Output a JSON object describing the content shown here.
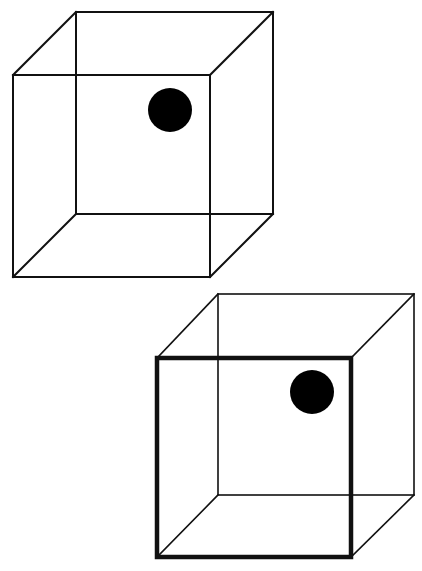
{
  "figure": {
    "type": "necker-cube-illusion",
    "background_color": "#ffffff",
    "line_color": "#111111",
    "dot_color": "#000000"
  },
  "cubes": [
    {
      "id": "ambiguous-cube",
      "front_face": {
        "x1": 13,
        "y1": 75,
        "x2": 210,
        "y2": 277,
        "stroke_width": 2
      },
      "back_face": {
        "x1": 76,
        "y1": 12,
        "x2": 273,
        "y2": 214,
        "stroke_width": 2
      },
      "connector_stroke_width": 2,
      "dot": {
        "cx": 170,
        "cy": 110,
        "r": 22
      }
    },
    {
      "id": "disambiguated-cube",
      "front_face": {
        "x1": 157,
        "y1": 358,
        "x2": 351,
        "y2": 557,
        "stroke_width": 4.5
      },
      "back_face": {
        "x1": 218,
        "y1": 294,
        "x2": 414,
        "y2": 495,
        "stroke_width": 1.6
      },
      "connector_stroke_width": 1.6,
      "dot": {
        "cx": 312,
        "cy": 392,
        "r": 22
      }
    }
  ]
}
